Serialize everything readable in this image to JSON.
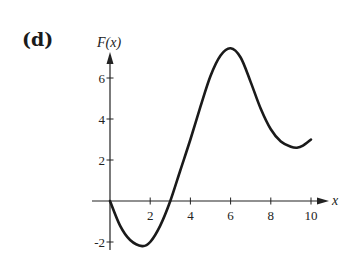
{
  "panel_label": "(d)",
  "chart_data": {
    "type": "line",
    "title": "",
    "panel": "(d)",
    "xlabel": "x",
    "ylabel": "F(x)",
    "xlim": [
      0,
      10
    ],
    "ylim": [
      -2.2,
      7.5
    ],
    "x_ticks": [
      2,
      4,
      6,
      8,
      10
    ],
    "y_ticks": [
      -2,
      2,
      4,
      6
    ],
    "grid": false,
    "legend": null,
    "series": [
      {
        "name": "F(x)",
        "x": [
          0,
          0.5,
          1.0,
          1.6,
          2.0,
          2.5,
          3.0,
          3.5,
          4.0,
          4.5,
          5.0,
          5.5,
          6.0,
          6.5,
          7.0,
          7.5,
          8.0,
          8.5,
          9.0,
          9.3,
          9.6,
          10.0
        ],
        "values": [
          0,
          -1.2,
          -1.9,
          -2.2,
          -2.0,
          -1.2,
          0,
          1.5,
          3.0,
          4.6,
          6.1,
          7.1,
          7.45,
          7.0,
          5.8,
          4.5,
          3.5,
          2.9,
          2.65,
          2.6,
          2.7,
          3.0
        ]
      }
    ],
    "annotations": [
      {
        "text": "minimum",
        "x": 1.6,
        "y": -2.2
      },
      {
        "text": "maximum",
        "x": 6.0,
        "y": 7.45
      },
      {
        "text": "local minimum",
        "x": 9.3,
        "y": 2.6
      }
    ]
  }
}
